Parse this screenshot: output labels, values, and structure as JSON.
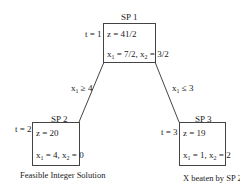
{
  "nodes": [
    {
      "id": "SP1",
      "title": "SP 1",
      "t_label": "t = 1",
      "z": "z = 41/2",
      "x1": "7/2",
      "x2": "3/2",
      "note": ""
    },
    {
      "id": "SP2",
      "title": "SP 2",
      "t_label": "t = 2",
      "z": "z = 20",
      "x1": "4",
      "x2": "0",
      "note": "Feasible Integer Solution"
    },
    {
      "id": "SP3",
      "title": "SP 3",
      "t_label": "t = 3",
      "z": "z = 19",
      "x1": "1",
      "x2": "2",
      "note": "X beaten by SP 2"
    }
  ],
  "edges": [
    {
      "from": "SP1",
      "to": "SP2",
      "label_var": "x",
      "label_sub": "1",
      "label_op": " ≥ 4"
    },
    {
      "from": "SP1",
      "to": "SP3",
      "label_var": "x",
      "label_sub": "1",
      "label_op": " ≤ 3"
    }
  ],
  "sym": {
    "x": "x",
    "s1": "1",
    "s2": "2",
    "eq": " = ",
    "comma": ", "
  }
}
